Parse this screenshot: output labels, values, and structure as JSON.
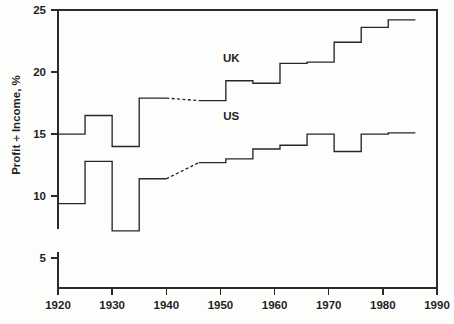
{
  "chart_data": {
    "type": "line",
    "title": "",
    "xlabel": "",
    "ylabel": "Profit ÷ Income, %",
    "xlim": [
      1920,
      1990
    ],
    "ylim": [
      2.7,
      25
    ],
    "grid": false,
    "legend_position": "inline-annotation",
    "xticks": [
      1920,
      1930,
      1940,
      1950,
      1960,
      1970,
      1980,
      1990
    ],
    "xtick_labels": [
      "1920",
      "1930",
      "1940",
      "1950",
      "1960",
      "1970",
      "1980",
      "1990"
    ],
    "yticks": [
      5,
      10,
      15,
      20,
      25
    ],
    "ytick_labels": [
      "5",
      "10",
      "15",
      "20",
      "25"
    ],
    "step_style": "post",
    "annotations": [
      {
        "text": "UK",
        "x": 1952,
        "y": 20.8
      },
      {
        "text": "US",
        "x": 1952,
        "y": 16.1
      }
    ],
    "series": [
      {
        "name": "UK",
        "label": "UK",
        "color": "#272727",
        "steps": [
          {
            "x_start": 1920,
            "x_end": 1925,
            "value": 15.0,
            "dashed": false
          },
          {
            "x_start": 1925,
            "x_end": 1930,
            "value": 16.5,
            "dashed": false
          },
          {
            "x_start": 1930,
            "x_end": 1935,
            "value": 14.0,
            "dashed": false
          },
          {
            "x_start": 1935,
            "x_end": 1940,
            "value": 17.9,
            "dashed": false
          },
          {
            "x_start": 1940,
            "x_end": 1946,
            "value": null,
            "dashed": true
          },
          {
            "x_start": 1946,
            "x_end": 1951,
            "value": 17.7,
            "dashed": false
          },
          {
            "x_start": 1951,
            "x_end": 1956,
            "value": 19.3,
            "dashed": false
          },
          {
            "x_start": 1956,
            "x_end": 1961,
            "value": 19.1,
            "dashed": false
          },
          {
            "x_start": 1961,
            "x_end": 1966,
            "value": 20.7,
            "dashed": false
          },
          {
            "x_start": 1966,
            "x_end": 1971,
            "value": 20.8,
            "dashed": false
          },
          {
            "x_start": 1971,
            "x_end": 1976,
            "value": 22.4,
            "dashed": false
          },
          {
            "x_start": 1976,
            "x_end": 1981,
            "value": 23.6,
            "dashed": false
          },
          {
            "x_start": 1981,
            "x_end": 1986,
            "value": 24.2,
            "dashed": false
          }
        ],
        "dashed_bridge": {
          "x_start": 1940,
          "y_start": 17.9,
          "x_end": 1946,
          "y_end": 17.7
        }
      },
      {
        "name": "US",
        "label": "US",
        "color": "#272727",
        "steps": [
          {
            "x_start": 1920,
            "x_end": 1925,
            "value": 9.4,
            "dashed": false
          },
          {
            "x_start": 1925,
            "x_end": 1930,
            "value": 12.8,
            "dashed": false
          },
          {
            "x_start": 1930,
            "x_end": 1935,
            "value": 7.2,
            "dashed": false
          },
          {
            "x_start": 1935,
            "x_end": 1940,
            "value": 11.4,
            "dashed": false
          },
          {
            "x_start": 1940,
            "x_end": 1946,
            "value": null,
            "dashed": true
          },
          {
            "x_start": 1946,
            "x_end": 1951,
            "value": 12.7,
            "dashed": false
          },
          {
            "x_start": 1951,
            "x_end": 1956,
            "value": 13.0,
            "dashed": false
          },
          {
            "x_start": 1956,
            "x_end": 1961,
            "value": 13.8,
            "dashed": false
          },
          {
            "x_start": 1961,
            "x_end": 1966,
            "value": 14.1,
            "dashed": false
          },
          {
            "x_start": 1966,
            "x_end": 1971,
            "value": 15.0,
            "dashed": false
          },
          {
            "x_start": 1971,
            "x_end": 1976,
            "value": 13.6,
            "dashed": false
          },
          {
            "x_start": 1976,
            "x_end": 1981,
            "value": 15.0,
            "dashed": false
          },
          {
            "x_start": 1981,
            "x_end": 1986,
            "value": 15.1,
            "dashed": false
          }
        ],
        "dashed_bridge": {
          "x_start": 1940,
          "y_start": 11.4,
          "x_end": 1946,
          "y_end": 12.7
        }
      }
    ]
  },
  "geometry": {
    "plot_left": 58,
    "plot_right": 437,
    "plot_top": 10,
    "plot_bottom": 288,
    "y_value_at_top": 25,
    "y_value_at_bottom": 2.6,
    "tick_length": 7,
    "left_axis_stub_top": 229,
    "left_axis_stub_bottom": 252
  }
}
